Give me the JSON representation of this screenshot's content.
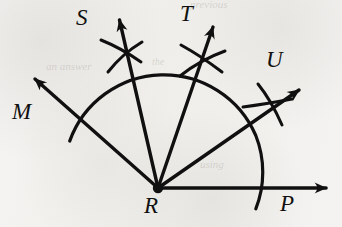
{
  "figure": {
    "type": "geometry-construction-diagram",
    "background_color": "#f3f2f0",
    "ink_color": "#111010",
    "vertex": {
      "name": "R",
      "label": "R",
      "x": 158,
      "y": 188
    },
    "rays": [
      {
        "name": "ray-M",
        "label": "M",
        "label_x": 14,
        "label_y": 103,
        "tip_x": 27,
        "tip_y": 72,
        "has_arrowhead": true,
        "has_construction_arcs": false
      },
      {
        "name": "ray-S",
        "label": "S",
        "label_x": 76,
        "label_y": 8,
        "tip_x": 116,
        "tip_y": 8,
        "has_arrowhead": true,
        "has_construction_arcs": true,
        "arc_cross_x": 122,
        "arc_cross_y": 50
      },
      {
        "name": "ray-T",
        "label": "T",
        "label_x": 180,
        "label_y": 4,
        "tip_x": 218,
        "tip_y": 14,
        "has_arrowhead": true,
        "has_construction_arcs": true,
        "arc_cross_x": 203,
        "arc_cross_y": 57
      },
      {
        "name": "ray-U",
        "label": "U",
        "label_x": 266,
        "label_y": 50,
        "tip_x": 305,
        "tip_y": 82,
        "has_arrowhead": true,
        "has_construction_arcs": true,
        "arc_cross_x": 272,
        "arc_cross_y": 103
      },
      {
        "name": "ray-P",
        "label": "P",
        "label_x": 280,
        "label_y": 193,
        "tip_x": 333,
        "tip_y": 188,
        "has_arrowhead": true,
        "has_construction_arcs": false
      }
    ],
    "main_arc": {
      "name": "compass-arc",
      "center_x": 158,
      "center_y": 188,
      "radius": 100,
      "start_angle_deg": 152,
      "end_angle_deg": -12
    },
    "ghost_marks": [
      {
        "text": "previous",
        "x": 190,
        "y": 1,
        "size": 11
      },
      {
        "text": "an answer",
        "x": 46,
        "y": 62,
        "size": 11
      },
      {
        "text": "the",
        "x": 152,
        "y": 58,
        "size": 10
      },
      {
        "text": "using",
        "x": 200,
        "y": 160,
        "size": 11
      }
    ]
  }
}
